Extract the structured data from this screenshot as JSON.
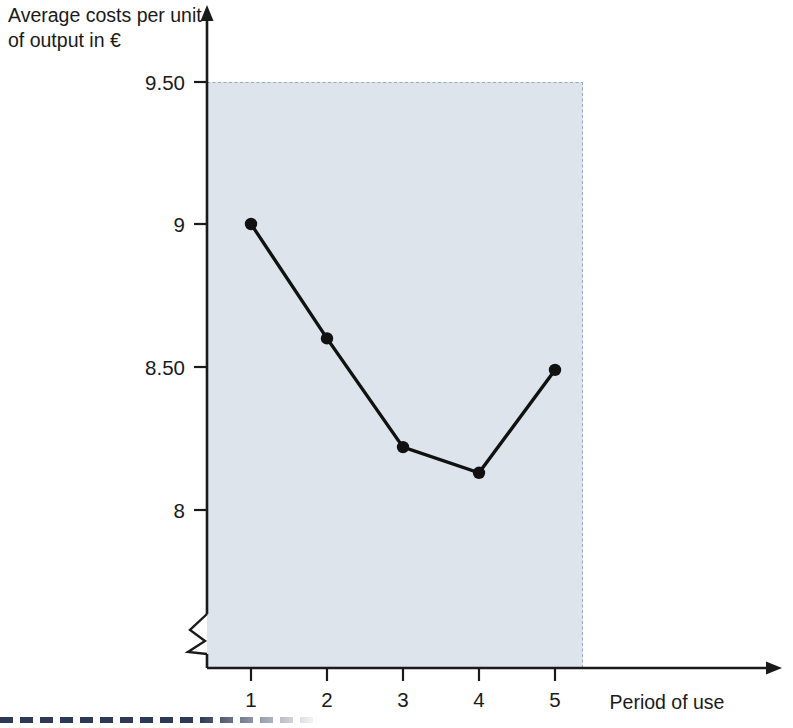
{
  "chart_data": {
    "type": "line",
    "title": "",
    "subtitle": "",
    "xlabel": "Period of use",
    "ylabel": "Average costs per unit of output in €",
    "ylabel_lines": [
      "Average costs per unit",
      "of output in €"
    ],
    "categories": [
      1,
      2,
      3,
      4,
      5
    ],
    "x": [
      1,
      2,
      3,
      4,
      5
    ],
    "values": [
      9.0,
      8.6,
      8.22,
      8.13,
      8.49
    ],
    "series": [
      {
        "name": "Average costs per unit of output",
        "values": [
          9.0,
          8.6,
          8.22,
          8.13,
          8.49
        ],
        "color": "#111111",
        "marker": "circle"
      }
    ],
    "xtick_labels": [
      "1",
      "2",
      "3",
      "4",
      "5"
    ],
    "ytick_labels": [
      "9.50",
      "9",
      "8.50",
      "8"
    ],
    "ytick_values": [
      9.5,
      9.0,
      8.5,
      8.0
    ],
    "ylim": [
      7.75,
      9.5
    ],
    "xlim": [
      0.3,
      5.6
    ],
    "y_axis_break": true,
    "grid": false,
    "legend": false,
    "legend_position": "none",
    "plot_background": "#dde4ec",
    "axis_color": "#1a1a1a",
    "annotations": []
  },
  "axes": {
    "y_title_line1": "Average costs per unit",
    "y_title_line2": "of output in €",
    "x_title": "Period of use",
    "y_ticks": [
      {
        "label": "9.50",
        "value": 9.5
      },
      {
        "label": "9",
        "value": 9.0
      },
      {
        "label": "8.50",
        "value": 8.5
      },
      {
        "label": "8",
        "value": 8.0
      }
    ],
    "x_ticks": [
      {
        "label": "1",
        "value": 1
      },
      {
        "label": "2",
        "value": 2
      },
      {
        "label": "3",
        "value": 3
      },
      {
        "label": "4",
        "value": 4
      },
      {
        "label": "5",
        "value": 5
      }
    ]
  },
  "colors": {
    "plot_fill": "#dde4ec",
    "plot_border": "#aab6c6",
    "axis": "#1a1a1a",
    "line": "#111111",
    "marker": "#111111",
    "bottom_rule": "#2d3a57"
  }
}
